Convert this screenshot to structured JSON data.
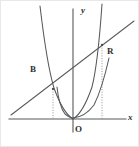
{
  "figure": {
    "kind": "coordinate-geometry-diagram",
    "width": 139,
    "height": 147,
    "background_color": "#ffffff",
    "ink_color": "#57585a",
    "label_color": "#2e2f31",
    "dotted_color": "#8d8e90"
  },
  "axes": {
    "x_axis": {
      "label": "x",
      "label_x": 127,
      "label_y": 112,
      "y_pixel": 118,
      "x_start": 8,
      "x_end": 125
    },
    "y_axis": {
      "label": "y",
      "label_x": 80,
      "label_y": 5,
      "x_pixel": 72,
      "y_start": 8,
      "y_end": 131
    },
    "origin": {
      "label": "O",
      "label_x": 74,
      "label_y": 124,
      "x_pixel": 72,
      "y_pixel": 118
    }
  },
  "points": [
    {
      "id": "B",
      "label": "B",
      "label_x": 29,
      "label_y": 64,
      "x_pixel": 52,
      "y_pixel": 88,
      "has_drop_line": true,
      "on": "narrow-parabola"
    },
    {
      "id": "R",
      "label": "R",
      "label_x": 106,
      "label_y": 46,
      "x_pixel": 101,
      "y_pixel": 44,
      "has_drop_line": true,
      "on": "narrow-parabola"
    }
  ],
  "curves": [
    {
      "id": "narrow-parabola",
      "type": "parabola",
      "opens": "up",
      "vertex_pixel": [
        72,
        118
      ],
      "path": "M 39,5 Q 46,64 53,87 Q 62,112 72,118 Q 82,112 91,86 Q 97,62 101,3"
    },
    {
      "id": "wide-parabola",
      "type": "parabola",
      "opens": "up",
      "vertex_pixel": [
        72,
        116
      ],
      "path": "M 56,86 Q 58,105 64,113 Q 69,117 72,117 Q 84,116 93,104 Q 101,88 108,57"
    },
    {
      "id": "secant-line",
      "type": "line",
      "through_points": [
        "B",
        "R"
      ],
      "path": "M 10,114 L 133,20"
    }
  ],
  "drop_lines": [
    {
      "from_point": "B",
      "path": "M 52,88 L 52,118"
    },
    {
      "from_point": "R",
      "path": "M 101,44 L 101,118"
    }
  ]
}
